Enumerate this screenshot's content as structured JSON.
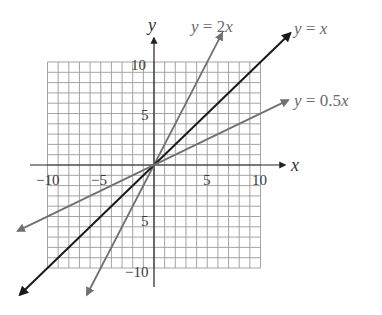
{
  "chart_data": {
    "type": "line",
    "title": "",
    "xlabel": "x",
    "ylabel": "y",
    "xlim": [
      -10,
      10
    ],
    "ylim": [
      -10,
      10
    ],
    "grid": true,
    "grid_step": 1,
    "x_ticks": [
      -10,
      -5,
      5,
      10
    ],
    "y_ticks": [
      10,
      5,
      -5,
      -10
    ],
    "x_tick_labels": [
      "−10",
      "−5",
      "5",
      "10"
    ],
    "y_tick_labels": [
      "10",
      "5",
      "5",
      "−10"
    ],
    "legend_position": "inline labels at line ends",
    "series": [
      {
        "name": "y = 2x",
        "slope": 2,
        "color": "#707070",
        "x": [
          -6.3,
          6.4
        ],
        "y": [
          -12.6,
          12.8
        ],
        "label_parts": [
          "y",
          " = 2",
          "x"
        ]
      },
      {
        "name": "y = x",
        "slope": 1,
        "color": "#1a1a1a",
        "x": [
          -12.6,
          12.8
        ],
        "y": [
          -12.6,
          12.8
        ],
        "label_parts": [
          "y",
          " = ",
          "x"
        ]
      },
      {
        "name": "y = 0.5x",
        "slope": 0.5,
        "color": "#707070",
        "x": [
          -12.8,
          12.6
        ],
        "y": [
          -6.4,
          6.3
        ],
        "label_parts": [
          "y",
          " = 0.5",
          "x"
        ]
      }
    ]
  },
  "geometry": {
    "origin_px": [
      154,
      165
    ],
    "unit_x_px": 10.65,
    "unit_y_px": 10.3,
    "grid_color": "#9a9a9a",
    "axis_color": "#222222"
  }
}
